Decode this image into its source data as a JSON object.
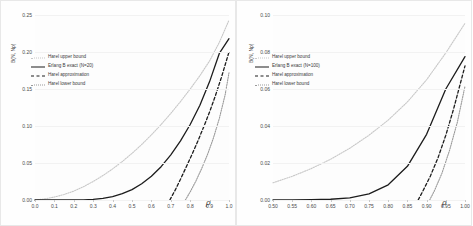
{
  "figure": {
    "background": "#ffffff",
    "panel_count": 2
  },
  "colors": {
    "upper_bound": "#c8c8c8",
    "exact": "#1c1c1c",
    "approximation": "#1c1c1c",
    "lower_bound": "#9a9a9a",
    "grid": "#f2f2f2",
    "axis": "#c9c9c9",
    "text": "#3a3a3a"
  },
  "chart_data": [
    {
      "type": "line",
      "panel": "left",
      "title": "",
      "xlabel": "ρ",
      "ylabel": "B(N, Nρ)",
      "xlim": [
        0.0,
        1.0
      ],
      "ylim": [
        0.0,
        0.25
      ],
      "grid": true,
      "legend_position": "upper-left",
      "xticks": [
        "0.0",
        "0.1",
        "0.2",
        "0.3",
        "0.4",
        "0.5",
        "0.6",
        "0.7",
        "0.8",
        "0.9",
        "1.0"
      ],
      "xtick_values": [
        0.0,
        0.1,
        0.2,
        0.3,
        0.4,
        0.5,
        0.6,
        0.7,
        0.8,
        0.9,
        1.0
      ],
      "yticks": [
        "0.00",
        "0.05",
        "0.10",
        "0.15",
        "0.20",
        "0.25"
      ],
      "ytick_values": [
        0.0,
        0.05,
        0.1,
        0.15,
        0.2,
        0.25
      ],
      "series": [
        {
          "name": "Harel upper bound",
          "style": "dotted",
          "color": "#c8c8c8",
          "x": [
            0.0,
            0.05,
            0.1,
            0.15,
            0.2,
            0.25,
            0.3,
            0.35,
            0.4,
            0.45,
            0.5,
            0.55,
            0.6,
            0.65,
            0.7,
            0.75,
            0.8,
            0.85,
            0.9,
            0.95,
            1.0
          ],
          "values": [
            0.0,
            0.0015,
            0.004,
            0.0075,
            0.012,
            0.018,
            0.025,
            0.033,
            0.042,
            0.052,
            0.063,
            0.075,
            0.088,
            0.102,
            0.117,
            0.133,
            0.15,
            0.168,
            0.188,
            0.213,
            0.243
          ]
        },
        {
          "name": "Erlang B exact (N=20)",
          "style": "solid",
          "color": "#1c1c1c",
          "x": [
            0.0,
            0.05,
            0.1,
            0.15,
            0.2,
            0.25,
            0.3,
            0.35,
            0.4,
            0.45,
            0.5,
            0.55,
            0.6,
            0.65,
            0.7,
            0.75,
            0.8,
            0.85,
            0.9,
            0.95,
            1.0
          ],
          "values": [
            0.0,
            0.0,
            0.0,
            0.0,
            0.0001,
            0.0003,
            0.0009,
            0.0022,
            0.0046,
            0.0085,
            0.014,
            0.022,
            0.032,
            0.045,
            0.061,
            0.08,
            0.102,
            0.128,
            0.16,
            0.198,
            0.218
          ]
        },
        {
          "name": "Harel approximation",
          "style": "dashed",
          "color": "#1c1c1c",
          "x": [
            0.695,
            0.72,
            0.75,
            0.78,
            0.81,
            0.84,
            0.87,
            0.9,
            0.93,
            0.96,
            1.0
          ],
          "values": [
            0.0,
            0.012,
            0.028,
            0.045,
            0.062,
            0.08,
            0.099,
            0.119,
            0.141,
            0.165,
            0.2
          ]
        },
        {
          "name": "Harel lower bound",
          "style": "dotted",
          "color": "#9a9a9a",
          "x": [
            0.775,
            0.8,
            0.83,
            0.86,
            0.89,
            0.92,
            0.95,
            0.98,
            1.0
          ],
          "values": [
            0.0,
            0.011,
            0.026,
            0.043,
            0.062,
            0.084,
            0.11,
            0.142,
            0.172
          ]
        }
      ]
    },
    {
      "type": "line",
      "panel": "right",
      "title": "",
      "xlabel": "ρ",
      "ylabel": "B(N, Nρ)",
      "xlim": [
        0.5,
        1.0
      ],
      "ylim": [
        0.0,
        0.1
      ],
      "grid": true,
      "legend_position": "upper-left",
      "xticks": [
        "0.50",
        "0.55",
        "0.60",
        "0.65",
        "0.70",
        "0.75",
        "0.80",
        "0.85",
        "0.90",
        "0.95",
        "1.00"
      ],
      "xtick_values": [
        0.5,
        0.55,
        0.6,
        0.65,
        0.7,
        0.75,
        0.8,
        0.85,
        0.9,
        0.95,
        1.0
      ],
      "yticks": [
        "0.00",
        "0.02",
        "0.04",
        "0.06",
        "0.08",
        "0.10"
      ],
      "ytick_values": [
        0.0,
        0.02,
        0.04,
        0.06,
        0.08,
        0.1
      ],
      "series": [
        {
          "name": "Harel upper bound",
          "style": "dotted",
          "color": "#c8c8c8",
          "x": [
            0.5,
            0.55,
            0.6,
            0.65,
            0.7,
            0.75,
            0.8,
            0.85,
            0.9,
            0.95,
            1.0
          ],
          "values": [
            0.0093,
            0.0128,
            0.017,
            0.022,
            0.028,
            0.035,
            0.0432,
            0.053,
            0.065,
            0.0795,
            0.0955
          ]
        },
        {
          "name": "Erlang B exact (N=100)",
          "style": "solid",
          "color": "#1c1c1c",
          "x": [
            0.5,
            0.55,
            0.6,
            0.65,
            0.7,
            0.75,
            0.8,
            0.85,
            0.9,
            0.95,
            1.0
          ],
          "values": [
            2e-05,
            5e-05,
            0.00014,
            0.0004,
            0.0012,
            0.0033,
            0.0082,
            0.0182,
            0.0355,
            0.06,
            0.0775
          ]
        },
        {
          "name": "Harel approximation",
          "style": "dashed",
          "color": "#1c1c1c",
          "x": [
            0.878,
            0.89,
            0.91,
            0.93,
            0.95,
            0.97,
            1.0
          ],
          "values": [
            0.0,
            0.0047,
            0.013,
            0.023,
            0.035,
            0.049,
            0.0725
          ]
        },
        {
          "name": "Harel lower bound",
          "style": "dotted",
          "color": "#9a9a9a",
          "x": [
            0.908,
            0.92,
            0.94,
            0.96,
            0.98,
            1.0
          ],
          "values": [
            0.0,
            0.0048,
            0.0145,
            0.027,
            0.042,
            0.0615
          ]
        }
      ]
    }
  ],
  "panels": [
    {
      "id": "left",
      "ylabel": "B(N, Nρ)",
      "xlabel": "ρ",
      "xticks": [
        "0.0",
        "0.1",
        "0.2",
        "0.3",
        "0.4",
        "0.5",
        "0.6",
        "0.7",
        "0.8",
        "0.9",
        "1.0"
      ],
      "yticks": [
        "0.00",
        "0.05",
        "0.10",
        "0.15",
        "0.20",
        "0.25"
      ],
      "legend": [
        {
          "label": "Harel upper bound",
          "style": "dotted-light"
        },
        {
          "label": "Erlang B exact (N=20)",
          "style": "solid-black"
        },
        {
          "label": "Harel approximation",
          "style": "dashed-black"
        },
        {
          "label": "Harel lower bound",
          "style": "dotted-gray"
        }
      ]
    },
    {
      "id": "right",
      "ylabel": "B(N, Nρ)",
      "xlabel": "ρ",
      "xticks": [
        "0.50",
        "0.55",
        "0.60",
        "0.65",
        "0.70",
        "0.75",
        "0.80",
        "0.85",
        "0.90",
        "0.95",
        "1.00"
      ],
      "yticks": [
        "0.00",
        "0.02",
        "0.04",
        "0.06",
        "0.08",
        "0.10"
      ],
      "legend": [
        {
          "label": "Harel upper bound",
          "style": "dotted-light"
        },
        {
          "label": "Erlang B exact (N=100)",
          "style": "solid-black"
        },
        {
          "label": "Harel approximation",
          "style": "dashed-black"
        },
        {
          "label": "Harel lower bound",
          "style": "dotted-gray"
        }
      ]
    }
  ]
}
